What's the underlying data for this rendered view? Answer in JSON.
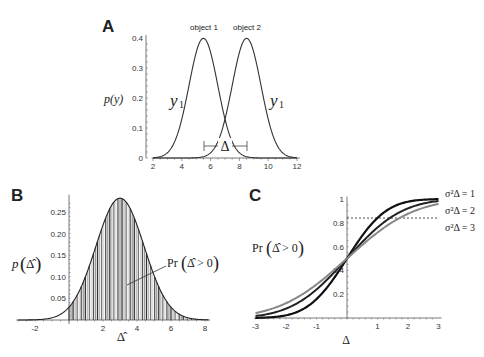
{
  "chart_data": [
    {
      "panel": "A",
      "type": "line",
      "title": "",
      "xlabel": "",
      "ylabel": "p(y)",
      "xlim": [
        2,
        12
      ],
      "ylim": [
        0,
        0.4
      ],
      "xticks": [
        "2",
        "4",
        "6",
        "8",
        "10",
        "12"
      ],
      "yticks": [
        "0",
        "0.1",
        "0.2",
        "0.3",
        "0.4"
      ],
      "series": [
        {
          "name": "object 1",
          "distribution": "normal",
          "mean": 5.5,
          "sd": 1,
          "curve_label": "y1"
        },
        {
          "name": "object 2",
          "distribution": "normal",
          "mean": 8.5,
          "sd": 1,
          "curve_label": "y1"
        }
      ],
      "annotations": [
        {
          "text": "object 1",
          "x": 5.5,
          "y": 0.4
        },
        {
          "text": "object 2",
          "x": 8.5,
          "y": 0.4
        },
        {
          "text": "Δ",
          "type": "interval",
          "from": 5.5,
          "to": 8.5,
          "y": 0.03
        }
      ],
      "grid": false
    },
    {
      "panel": "B",
      "type": "area",
      "title": "",
      "xlabel": "Δ̂",
      "ylabel": "p(Δ̂)",
      "xlim": [
        -3,
        8.2
      ],
      "ylim": [
        0,
        0.29
      ],
      "xticks": [
        "-2",
        "2",
        "4",
        "6",
        "8"
      ],
      "yticks": [
        "0.05",
        "0.10",
        "0.15",
        "0.20",
        "0.25"
      ],
      "series": [
        {
          "name": "p(Δ̂)",
          "distribution": "normal",
          "mean": 3,
          "sd": 1.414,
          "peak": 0.282
        }
      ],
      "shaded_region": {
        "from": 0,
        "to": 8.2,
        "label": "Pr(Δ̂ > 0)",
        "fill": "vertical hatching"
      },
      "grid": false
    },
    {
      "panel": "C",
      "type": "line",
      "title": "",
      "xlabel": "Δ",
      "ylabel": "Pr(Δ̂ > 0)",
      "xlim": [
        -3,
        3
      ],
      "ylim": [
        0,
        1
      ],
      "xticks": [
        "-3",
        "-2",
        "-1",
        "1",
        "2",
        "3"
      ],
      "yticks": [
        "0.2",
        "0.4",
        "0.6",
        "0.8",
        "1"
      ],
      "x": [
        -3,
        -2,
        -1,
        0,
        1,
        2,
        3
      ],
      "series": [
        {
          "name": "σ²_Δ = 1",
          "color": "#111111",
          "values": [
            0.001,
            0.023,
            0.159,
            0.5,
            0.841,
            0.977,
            0.999
          ]
        },
        {
          "name": "σ²_Δ = 2",
          "color": "#222222",
          "values": [
            0.017,
            0.079,
            0.24,
            0.5,
            0.76,
            0.921,
            0.983
          ]
        },
        {
          "name": "σ²_Δ = 3",
          "color": "#888888",
          "values": [
            0.042,
            0.124,
            0.282,
            0.5,
            0.718,
            0.876,
            0.958
          ]
        }
      ],
      "reference_line": {
        "y": 0.84,
        "style": "dashed",
        "from_x": 0,
        "to_x": 3
      },
      "legend_position": "right",
      "grid": false
    }
  ],
  "labels": {
    "panel_a": "A",
    "panel_b": "B",
    "panel_c": "C",
    "a_ylabel": "p(y)",
    "a_obj1": "object 1",
    "a_obj2": "object 2",
    "a_curve1": "y",
    "a_curve2": "y",
    "a_sub": "1",
    "a_delta": "Δ",
    "b_ylabel_p": "p",
    "b_ylabel_arg": "Δ̂",
    "b_xlabel": "Δ̂",
    "b_pr": "Pr",
    "b_pr_arg": "Δ̂ > 0",
    "c_ylabel_pr": "Pr",
    "c_ylabel_arg": "Δ̂ > 0",
    "c_xlabel": "Δ",
    "c_leg1": "σ²Δ = 1",
    "c_leg2": "σ²Δ = 2",
    "c_leg3": "σ²Δ = 3"
  }
}
